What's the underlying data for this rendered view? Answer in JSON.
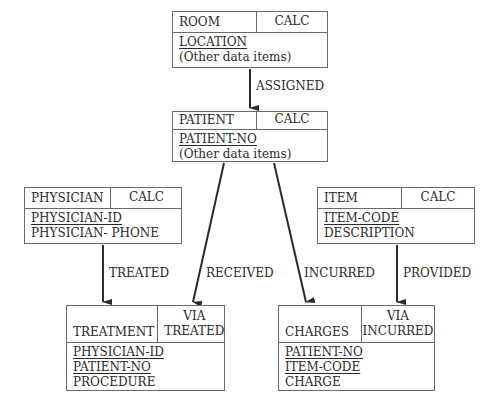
{
  "records": {
    "room": {
      "name": "ROOM",
      "location_mode": [
        "CALC"
      ],
      "keys": [
        "LOCATION"
      ],
      "fields": [
        "(Other data items)"
      ]
    },
    "patient": {
      "name": "PATIENT",
      "location_mode": [
        "CALC"
      ],
      "keys": [
        "PATIENT-NO"
      ],
      "fields": [
        "(Other data items)"
      ]
    },
    "physician": {
      "name": "PHYSICIAN",
      "location_mode": [
        "CALC"
      ],
      "keys": [
        "PHYSICIAN-ID"
      ],
      "fields": [
        "PHYSICIAN- PHONE"
      ]
    },
    "item": {
      "name": "ITEM",
      "location_mode": [
        "CALC"
      ],
      "keys": [
        "ITEM-CODE"
      ],
      "fields": [
        "DESCRIPTION"
      ]
    },
    "treatment": {
      "name": "TREATMENT",
      "location_mode": [
        "VIA",
        "TREATED"
      ],
      "keys": [
        "PHYSICIAN-ID",
        "PATIENT-NO"
      ],
      "fields": [
        "PROCEDURE"
      ]
    },
    "charges": {
      "name": "CHARGES",
      "location_mode": [
        "VIA",
        "INCURRED"
      ],
      "keys": [
        "PATIENT-NO",
        "ITEM-CODE"
      ],
      "fields": [
        "CHARGE"
      ]
    }
  },
  "sets": {
    "assigned": {
      "label": "ASSIGNED",
      "owner": "ROOM",
      "member": "PATIENT"
    },
    "treated": {
      "label": "TREATED",
      "owner": "PHYSICIAN",
      "member": "TREATMENT"
    },
    "received": {
      "label": "RECEIVED",
      "owner": "PATIENT",
      "member": "TREATMENT"
    },
    "incurred": {
      "label": "INCURRED",
      "owner": "PATIENT",
      "member": "CHARGES"
    },
    "provided": {
      "label": "PROVIDED",
      "owner": "ITEM",
      "member": "CHARGES"
    }
  },
  "colors": {
    "line": "#6a6a6a",
    "arrow": "#2a2a2a",
    "text": "#2a2a2a"
  }
}
